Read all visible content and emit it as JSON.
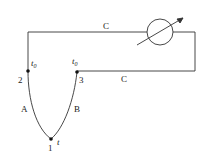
{
  "diagram": {
    "wires": {
      "top_label": "C",
      "bottom_label": "C"
    },
    "conductors": {
      "left_label": "A",
      "right_label": "B"
    },
    "nodes": {
      "junction_hot": {
        "number": "1",
        "temp": "t",
        "temp_sub": ""
      },
      "junction_left": {
        "number": "2",
        "temp": "t",
        "temp_sub": "0"
      },
      "junction_right": {
        "number": "3",
        "temp": "t",
        "temp_sub": "0"
      }
    },
    "meter": {
      "icon": "variable-meter-icon"
    },
    "colors": {
      "line": "#333333",
      "background": "#ffffff"
    }
  }
}
